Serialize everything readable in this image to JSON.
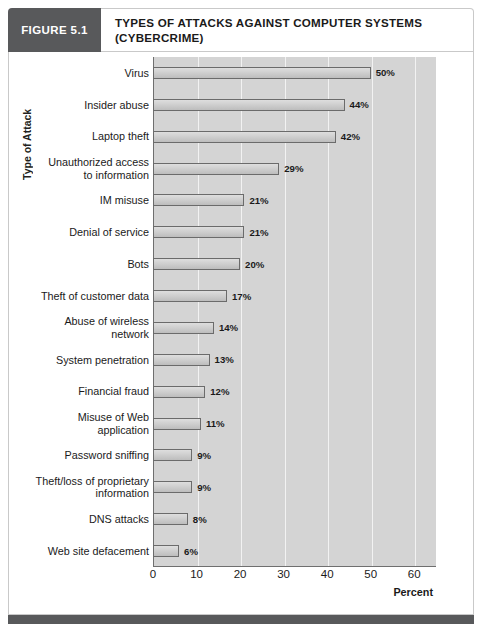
{
  "figure": {
    "badge_label": "FIGURE 5.1",
    "title_line1": "TYPES OF ATTACKS AGAINST COMPUTER SYSTEMS",
    "title_line2": "(CYBERCRIME)",
    "accent_color": "#58595b",
    "plot_background": "#d4d4d4",
    "bar_fill": "#cecece",
    "bar_border": "#6b6b6b"
  },
  "chart_data": {
    "type": "bar",
    "orientation": "horizontal",
    "title": "TYPES OF ATTACKS AGAINST COMPUTER SYSTEMS (CYBERCRIME)",
    "xlabel": "Percent",
    "ylabel": "Type of Attack",
    "xlim": [
      0,
      65
    ],
    "xticks": [
      0,
      10,
      20,
      30,
      40,
      50,
      60
    ],
    "xticklabels": [
      "0",
      "10",
      "20",
      "30",
      "40",
      "50",
      "60"
    ],
    "grid": "vertical",
    "legend": "none",
    "categories": [
      "Virus",
      "Insider abuse",
      "Laptop theft",
      "Unauthorized access\nto information",
      "IM misuse",
      "Denial of service",
      "Bots",
      "Theft of customer data",
      "Abuse of wireless\nnetwork",
      "System penetration",
      "Financial fraud",
      "Misuse of Web\napplication",
      "Password sniffing",
      "Theft/loss of proprietary\ninformation",
      "DNS attacks",
      "Web site defacement"
    ],
    "values": [
      50,
      44,
      42,
      29,
      21,
      21,
      20,
      17,
      14,
      13,
      12,
      11,
      9,
      9,
      8,
      6
    ],
    "data_labels": [
      "50%",
      "44%",
      "42%",
      "29%",
      "21%",
      "21%",
      "20%",
      "17%",
      "14%",
      "13%",
      "12%",
      "11%",
      "9%",
      "9%",
      "8%",
      "6%"
    ],
    "rows": [
      {
        "label_line1": "Virus",
        "label_line2": "",
        "value": 50,
        "data_label": "50%"
      },
      {
        "label_line1": "Insider abuse",
        "label_line2": "",
        "value": 44,
        "data_label": "44%"
      },
      {
        "label_line1": "Laptop theft",
        "label_line2": "",
        "value": 42,
        "data_label": "42%"
      },
      {
        "label_line1": "Unauthorized access",
        "label_line2": "to information",
        "value": 29,
        "data_label": "29%"
      },
      {
        "label_line1": "IM misuse",
        "label_line2": "",
        "value": 21,
        "data_label": "21%"
      },
      {
        "label_line1": "Denial of service",
        "label_line2": "",
        "value": 21,
        "data_label": "21%"
      },
      {
        "label_line1": "Bots",
        "label_line2": "",
        "value": 20,
        "data_label": "20%"
      },
      {
        "label_line1": "Theft of customer data",
        "label_line2": "",
        "value": 17,
        "data_label": "17%"
      },
      {
        "label_line1": "Abuse of wireless",
        "label_line2": "network",
        "value": 14,
        "data_label": "14%"
      },
      {
        "label_line1": "System penetration",
        "label_line2": "",
        "value": 13,
        "data_label": "13%"
      },
      {
        "label_line1": "Financial fraud",
        "label_line2": "",
        "value": 12,
        "data_label": "12%"
      },
      {
        "label_line1": "Misuse of Web",
        "label_line2": "application",
        "value": 11,
        "data_label": "11%"
      },
      {
        "label_line1": "Password sniffing",
        "label_line2": "",
        "value": 9,
        "data_label": "9%"
      },
      {
        "label_line1": "Theft/loss of proprietary",
        "label_line2": "information",
        "value": 9,
        "data_label": "9%"
      },
      {
        "label_line1": "DNS attacks",
        "label_line2": "",
        "value": 8,
        "data_label": "8%"
      },
      {
        "label_line1": "Web site defacement",
        "label_line2": "",
        "value": 6,
        "data_label": "6%"
      }
    ]
  }
}
